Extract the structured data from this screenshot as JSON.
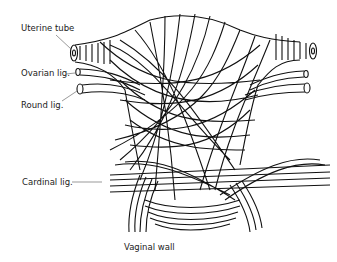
{
  "diagram": {
    "labels": {
      "uterine_tube": "Uterine tube",
      "ovarian_lig": "Ovarian lig.",
      "round_lig": "Round lig.",
      "cardinal_lig": "Cardinal lig.",
      "vaginal_wall": "Vaginal wall"
    },
    "colors": {
      "stroke": "#111111",
      "text": "#222222",
      "leader": "#555555",
      "background": "#ffffff"
    }
  }
}
